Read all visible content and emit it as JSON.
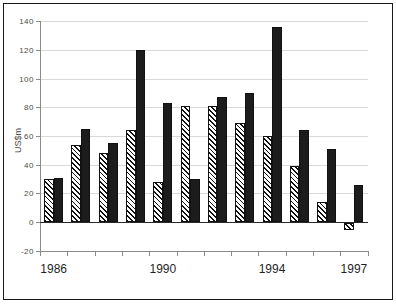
{
  "figure": {
    "background": "#ffffff",
    "frame_border": "#1a1a1a"
  },
  "colors": {
    "bar_solid": "#1c1c1c",
    "bar_border": "#111111",
    "hatch_stroke": "#111111",
    "hatch_background": "#ffffff",
    "axis": "#8a8a8a",
    "gridline": "#d9d9d9",
    "zero_line": "#2a2a2a",
    "tick_label": "#4a4a4a",
    "year_label": "#1f1f1f"
  },
  "chart_data": {
    "type": "bar",
    "title": "",
    "xlabel": "",
    "ylabel": "US$m",
    "ylim": [
      -20,
      140
    ],
    "ytick_step": 20,
    "ytick_labels": [
      "-20",
      "0",
      "20",
      "40",
      "60",
      "80",
      "100",
      "120",
      "140"
    ],
    "grid": "horizontal",
    "legend": "none",
    "categories": [
      "1986",
      "1987",
      "1988",
      "1989",
      "1990",
      "1991",
      "1992",
      "1993",
      "1994",
      "1995",
      "1996",
      "1997"
    ],
    "xticks_shown": [
      {
        "label": "1986",
        "category_index": 0
      },
      {
        "label": "1990",
        "category_index": 4
      },
      {
        "label": "1994",
        "category_index": 8
      },
      {
        "label": "1997",
        "category_index": 11
      }
    ],
    "series": [
      {
        "name": "hatched",
        "style": "diagonal-hatch",
        "values": [
          30,
          54,
          48,
          64,
          28,
          81,
          81,
          69,
          60,
          39,
          14,
          -5
        ]
      },
      {
        "name": "solid",
        "style": "solid-black",
        "values": [
          31,
          65,
          55,
          120,
          83,
          30,
          87,
          90,
          136,
          64,
          51,
          26
        ]
      }
    ]
  }
}
